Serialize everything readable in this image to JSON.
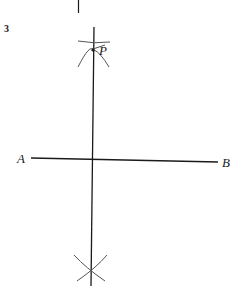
{
  "question_number": "3",
  "points": {
    "P": "P",
    "A": "A",
    "B": "B"
  },
  "colors": {
    "line": "#1a1a1a",
    "arc": "#555555",
    "background": "#ffffff"
  }
}
